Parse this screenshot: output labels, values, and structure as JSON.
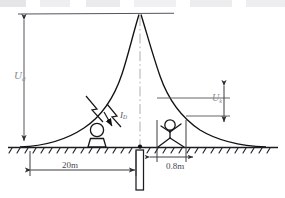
{
  "figure": {
    "labels": {
      "touch_voltage": {
        "symbol": "U",
        "subscript": "d"
      },
      "step_voltage": {
        "symbol": "U",
        "subscript": "k"
      },
      "current": {
        "symbol": "I",
        "subscript": "D"
      },
      "distance_left": "20m",
      "distance_step": "0.8m"
    },
    "colors": {
      "line": "#1a1a1a",
      "dim_line": "#3c3c42",
      "label_text": "#8a8a90",
      "dim_text": "#4a4a50",
      "ground": "#2a2a2e"
    },
    "elements": {
      "potential_curve": "bell-shaped potential distribution peaking at the electrode",
      "electrode": "vertical rod driven below ground",
      "ground_line": "hatched earth surface",
      "crouching_person": "person at 20 m from electrode",
      "walking_person": "person straddling 0.8 m step distance",
      "lightning_symbol": "lightning stroke injecting current"
    },
    "geometry": {
      "top_line_y": 14,
      "ground_y": 147,
      "peak_x": 140,
      "left_axis_x": 24,
      "electrode_x": 140
    }
  }
}
